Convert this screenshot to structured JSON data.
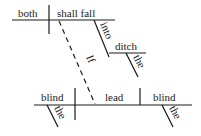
{
  "diagram": {
    "type": "sentence-diagram",
    "clause_main": {
      "subject": "both",
      "verb": "shall fall",
      "preposition": "into",
      "object_of_preposition": "ditch",
      "article": "the"
    },
    "connector": "If",
    "clause_sub": {
      "subject": "blind",
      "subject_article": "the",
      "verb": "lead",
      "object": "blind",
      "object_article": "the"
    }
  }
}
